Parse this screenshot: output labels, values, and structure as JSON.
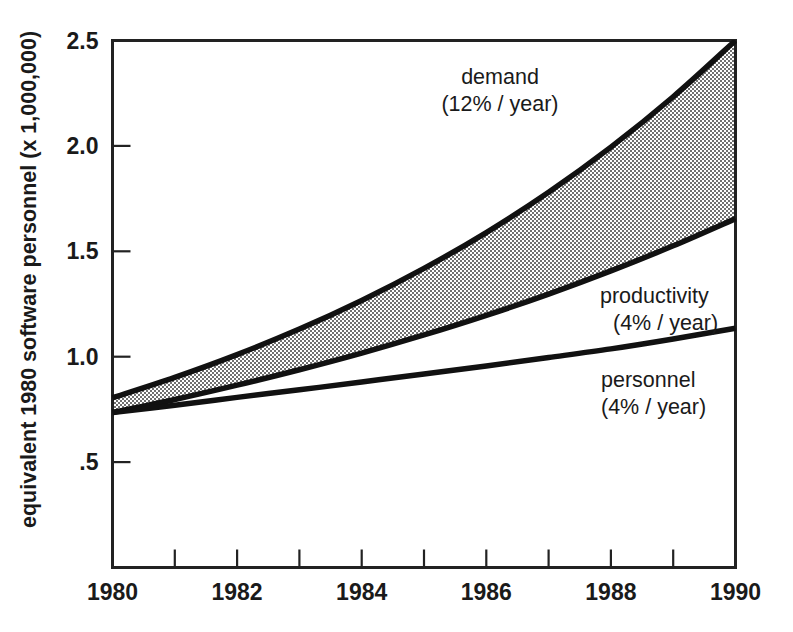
{
  "chart_data": {
    "type": "area",
    "title": "",
    "subtitle": "",
    "xlabel": "",
    "ylabel": "equivalent 1980 software personnel (x 1,000,000)",
    "xlim": [
      1980,
      1990
    ],
    "ylim": [
      0,
      2.5
    ],
    "grid": false,
    "legend_position": "inline-annotations",
    "x_tick_labels": [
      "1980",
      "1982",
      "1984",
      "1986",
      "1988",
      "1990"
    ],
    "x_tick_values": [
      1980,
      1982,
      1984,
      1986,
      1988,
      1990
    ],
    "x_minor_ticks": [
      1981,
      1983,
      1985,
      1987,
      1989
    ],
    "y_tick_labels": [
      ".5",
      "1.0",
      "1.5",
      "2.0",
      "2.5"
    ],
    "y_tick_values": [
      0.5,
      1.0,
      1.5,
      2.0,
      2.5
    ],
    "x": [
      1980,
      1981,
      1982,
      1983,
      1984,
      1985,
      1986,
      1987,
      1988,
      1989,
      1990
    ],
    "series": [
      {
        "name": "demand",
        "rate_label": "(12% / year)",
        "growth_percent_per_year": 12,
        "values": [
          0.805,
          0.902,
          1.01,
          1.131,
          1.267,
          1.419,
          1.589,
          1.78,
          1.994,
          2.233,
          2.5
        ]
      },
      {
        "name": "productivity",
        "rate_label": "(4% / year)",
        "growth_percent_per_year": 4,
        "values": [
          0.735,
          0.797,
          0.865,
          0.938,
          1.017,
          1.103,
          1.196,
          1.297,
          1.407,
          1.526,
          1.655
        ]
      },
      {
        "name": "personnel",
        "rate_label": "(4% / year)",
        "growth_percent_per_year": 4,
        "values": [
          0.735,
          0.77,
          0.807,
          0.843,
          0.88,
          0.918,
          0.956,
          0.996,
          1.037,
          1.084,
          1.135
        ]
      }
    ],
    "shaded_region": {
      "between": [
        "demand",
        "productivity"
      ],
      "fill_pattern": "50% checkerboard dither",
      "fill_color": "#808080"
    },
    "annotations": [
      {
        "id": "demand",
        "line1": "demand",
        "line2": "(12% / year)"
      },
      {
        "id": "productivity",
        "line1": "productivity",
        "line2": "(4% / year)"
      },
      {
        "id": "personnel",
        "line1": "personnel",
        "line2": "(4% / year)"
      }
    ],
    "colors": {
      "axis": "#222222",
      "curve": "#111111",
      "band": "#808080",
      "background": "#ffffff"
    }
  }
}
